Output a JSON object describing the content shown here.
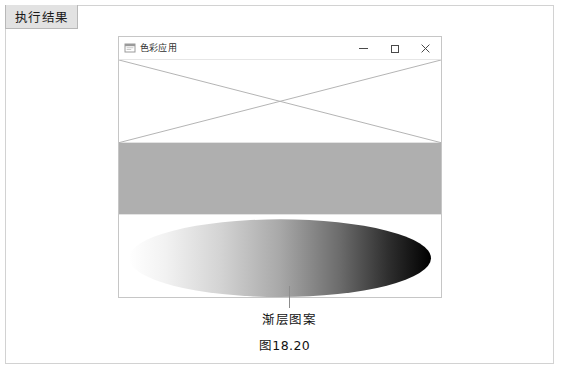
{
  "panel": {
    "tab_label": "执行结果"
  },
  "window": {
    "title": "色彩应用",
    "icon": "app-window-icon",
    "controls": {
      "minimize": "—",
      "maximize": "□",
      "close": "✕"
    }
  },
  "canvas": {
    "shapes": [
      {
        "name": "crossed-lines",
        "type": "lines",
        "stroke": "#b4b4b4",
        "description": "two diagonal lines forming an X across the upper region"
      },
      {
        "name": "gray-rectangle",
        "type": "rect",
        "fill": "#afafaf",
        "description": "solid gray filled rectangle"
      },
      {
        "name": "gradient-ellipse",
        "type": "ellipse",
        "gradient_from": "#ffffff",
        "gradient_to": "#000000",
        "gradient_direction": "horizontal left-to-right",
        "description": "ellipse filled with a white to black linear gradient"
      }
    ]
  },
  "annotation": {
    "callout_label": "渐层图案",
    "figure_number": "图18.20",
    "leader_color": "#8c8c8c"
  },
  "colors": {
    "frame_border": "#d2d2d2",
    "tab_background": "#e2e2e2",
    "window_border": "#c6c6c6",
    "gray_fill": "#afafaf",
    "line_stroke": "#b4b4b4"
  }
}
